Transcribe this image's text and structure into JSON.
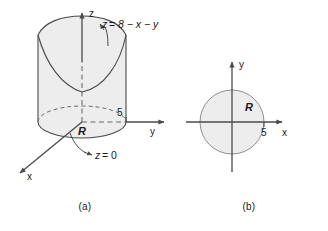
{
  "figure": {
    "background_color": "#ffffff",
    "line_color": "#4a4a4a",
    "text_color": "#1a1a1a",
    "fill_color": "#ededed",
    "dashed_color": "#6b6b6b"
  },
  "panel_a": {
    "caption": "(a)",
    "axes": {
      "z_label": "z",
      "y_label": "y",
      "x_label": "x"
    },
    "tick": {
      "value": "5",
      "axis": "y"
    },
    "region_label": "R",
    "annotations": [
      {
        "name": "top-plane-equation",
        "text": "z = 8 − x − y",
        "parts": {
          "lhs": "z",
          "equals": "=",
          "rhs": "8 − x − y"
        }
      },
      {
        "name": "bottom-plane-equation",
        "text": "z = 0",
        "parts": {
          "lhs": "z",
          "equals": "=",
          "rhs": "0"
        }
      }
    ]
  },
  "panel_b": {
    "caption": "(b)",
    "axes": {
      "y_label": "y",
      "x_label": "x"
    },
    "tick": {
      "value": "5",
      "axis": "x"
    },
    "region_label": "R",
    "shape": {
      "type": "circle",
      "radius_label": "5",
      "center": "origin"
    }
  },
  "math": {
    "minus_sign": "−",
    "equals_sign": "="
  }
}
